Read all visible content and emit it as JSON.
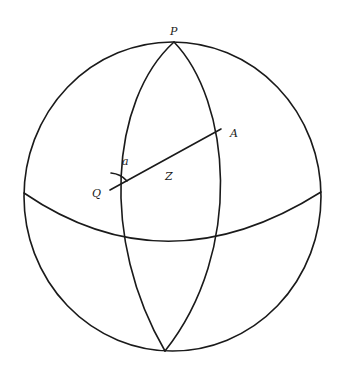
{
  "diagram": {
    "labels": {
      "pole": "P",
      "point_a": "A",
      "point_q": "Q",
      "angle": "a",
      "arc": "Z"
    },
    "colors": {
      "stroke": "#1a1a1a",
      "background": "#ffffff"
    }
  }
}
